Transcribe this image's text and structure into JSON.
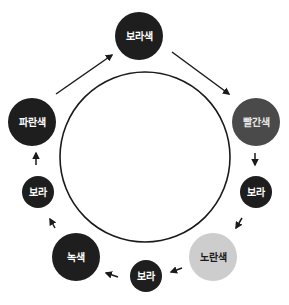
{
  "diagram": {
    "type": "cycle",
    "ring": {
      "cx": 145,
      "cy": 157,
      "r": 85,
      "stroke": "#1a1a1a"
    },
    "nodes": [
      {
        "id": "top",
        "label": "보라색",
        "cx": 139,
        "cy": 36,
        "r": 24,
        "fill": "#1e1e1e",
        "text_color": "#ffffff"
      },
      {
        "id": "red",
        "label": "빨간색",
        "cx": 256,
        "cy": 122,
        "r": 24,
        "fill": "#4a4a4a",
        "text_color": "#e8e8e8"
      },
      {
        "id": "purple-right",
        "label": "보라",
        "cx": 256,
        "cy": 192,
        "r": 16,
        "fill": "#1e1e1e",
        "text_color": "#ffffff"
      },
      {
        "id": "yellow",
        "label": "노란색",
        "cx": 213,
        "cy": 257,
        "r": 24,
        "fill": "#cdcdcd",
        "text_color": "#1a1a1a"
      },
      {
        "id": "purple-bottom",
        "label": "보라",
        "cx": 146,
        "cy": 276,
        "r": 16,
        "fill": "#1e1e1e",
        "text_color": "#ffffff"
      },
      {
        "id": "green",
        "label": "녹색",
        "cx": 76,
        "cy": 257,
        "r": 24,
        "fill": "#1e1e1e",
        "text_color": "#ffffff"
      },
      {
        "id": "purple-left",
        "label": "보라",
        "cx": 38,
        "cy": 192,
        "r": 16,
        "fill": "#1e1e1e",
        "text_color": "#ffffff"
      },
      {
        "id": "blue",
        "label": "파란색",
        "cx": 32,
        "cy": 122,
        "r": 24,
        "fill": "#1e1e1e",
        "text_color": "#ffffff"
      }
    ],
    "arrows": [
      {
        "from": "blue",
        "to": "top",
        "x1": 56,
        "y1": 94,
        "x2": 112,
        "y2": 55
      },
      {
        "from": "top",
        "to": "red",
        "x1": 172,
        "y1": 52,
        "x2": 229,
        "y2": 94
      },
      {
        "from": "red",
        "to": "purple-right",
        "x1": 255,
        "y1": 153,
        "x2": 255,
        "y2": 165
      },
      {
        "from": "purple-right",
        "to": "yellow",
        "x1": 242,
        "y1": 218,
        "x2": 236,
        "y2": 228
      },
      {
        "from": "yellow",
        "to": "purple-bottom",
        "x1": 182,
        "y1": 268,
        "x2": 171,
        "y2": 272
      },
      {
        "from": "purple-bottom",
        "to": "green",
        "x1": 118,
        "y1": 277,
        "x2": 106,
        "y2": 273
      },
      {
        "from": "purple-left",
        "to": "green",
        "x1": 55,
        "y1": 228,
        "x2": 50,
        "y2": 220,
        "note": "arrow points up toward 보라 from 녹색"
      },
      {
        "from": "purple-left",
        "to": "blue",
        "x1": 36,
        "y1": 165,
        "x2": 36,
        "y2": 153
      }
    ],
    "arrow_color": "#1a1a1a"
  }
}
